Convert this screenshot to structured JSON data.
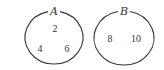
{
  "diagram": {
    "type": "venn-disjoint",
    "sets": [
      {
        "label": "A",
        "elements": [
          "2",
          "4",
          "6"
        ]
      },
      {
        "label": "B",
        "elements": [
          "8",
          "10"
        ]
      }
    ],
    "colors": {
      "stroke": "#333333",
      "background": "#ffffff"
    }
  }
}
